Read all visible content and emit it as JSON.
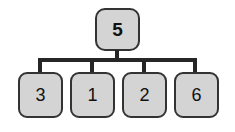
{
  "diagram": {
    "type": "tree",
    "background_color": "#ffffff",
    "node_fill_color": "#d4d4d4",
    "node_border_color": "#333333",
    "edge_color": "#262626",
    "root": {
      "label": "5",
      "emphasis": "bold"
    },
    "children": [
      {
        "label": "3",
        "emphasis": "normal"
      },
      {
        "label": "1",
        "emphasis": "normal"
      },
      {
        "label": "2",
        "emphasis": "normal"
      },
      {
        "label": "6",
        "emphasis": "normal"
      }
    ]
  }
}
